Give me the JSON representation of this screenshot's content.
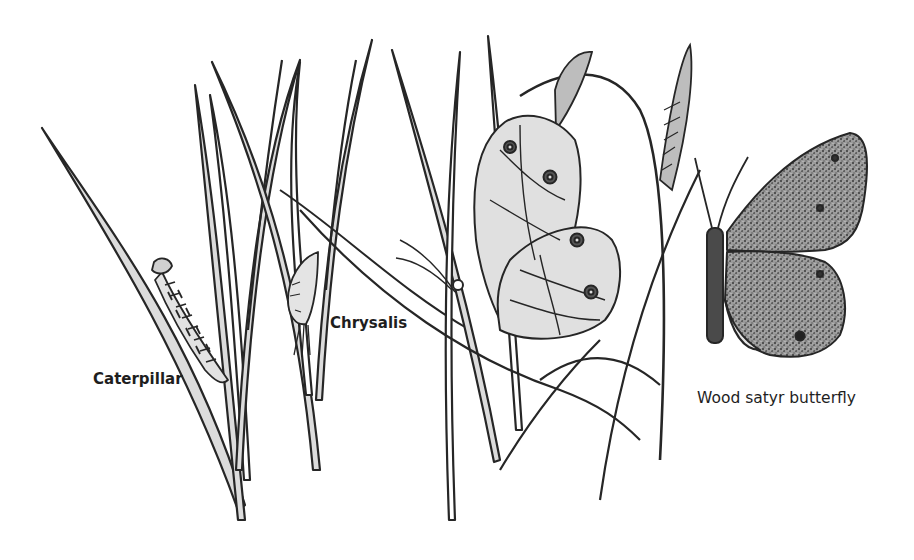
{
  "illustration": {
    "subject": "Wood satyr butterfly life cycle on grass",
    "labels": {
      "caterpillar": "Caterpillar",
      "chrysalis": "Chrysalis",
      "butterfly": "Wood satyr butterfly"
    },
    "colors": {
      "ink": "#262626",
      "fill": "#d8d8d8",
      "speckle": "#6a6a6a",
      "background": "#ffffff"
    }
  }
}
